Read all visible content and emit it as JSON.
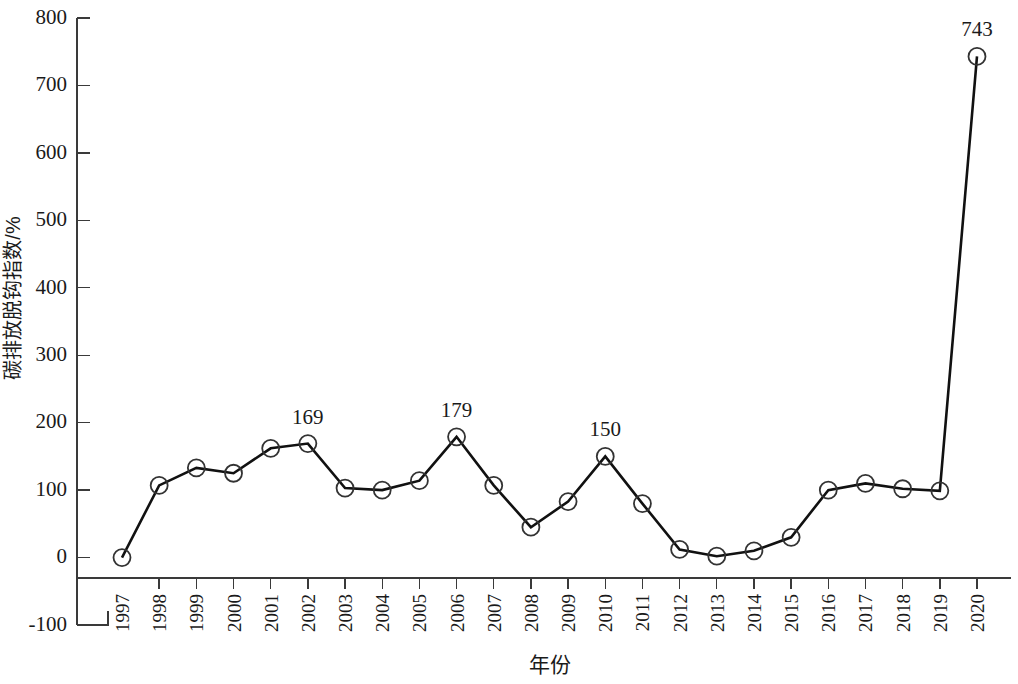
{
  "chart_data": {
    "type": "line",
    "title": "",
    "xlabel": "年份",
    "ylabel": "碳排放脱钩指数/%",
    "categories": [
      "1997",
      "1998",
      "1999",
      "2000",
      "2001",
      "2002",
      "2003",
      "2004",
      "2005",
      "2006",
      "2007",
      "2008",
      "2009",
      "2010",
      "2011",
      "2012",
      "2013",
      "2014",
      "2015",
      "2016",
      "2017",
      "2018",
      "2019",
      "2020"
    ],
    "values": [
      0,
      107,
      133,
      125,
      162,
      169,
      103,
      100,
      114,
      179,
      107,
      45,
      83,
      150,
      80,
      12,
      2,
      10,
      30,
      100,
      110,
      102,
      99,
      743
    ],
    "ylim": [
      -100,
      800
    ],
    "y_ticks": [
      "800",
      "700",
      "600",
      "500",
      "400",
      "300",
      "200",
      "100",
      "0",
      "-100"
    ],
    "y_tick_values": [
      800,
      700,
      600,
      500,
      400,
      300,
      200,
      100,
      0,
      -100
    ],
    "grid": false,
    "legend": "none",
    "marker": "open-circle",
    "line_color": "#111111",
    "marker_color": "#333333",
    "annotations": [
      {
        "category": "2002",
        "value": 169,
        "text": "169"
      },
      {
        "category": "2006",
        "value": 179,
        "text": "179"
      },
      {
        "category": "2010",
        "value": 150,
        "text": "150"
      },
      {
        "category": "2020",
        "value": 743,
        "text": "743"
      }
    ],
    "series": [
      {
        "name": "碳排放脱钩指数",
        "values": [
          0,
          107,
          133,
          125,
          162,
          169,
          103,
          100,
          114,
          179,
          107,
          45,
          83,
          150,
          80,
          12,
          2,
          10,
          30,
          100,
          110,
          102,
          99,
          743
        ]
      }
    ]
  }
}
